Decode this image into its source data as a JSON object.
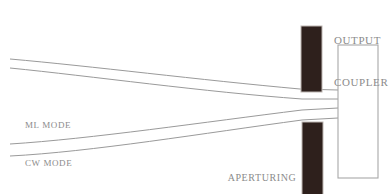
{
  "figure": {
    "type": "optical-schematic",
    "title_visible": false,
    "background_color": "#ffffff",
    "width": 391,
    "height": 194
  },
  "labels": {
    "ml_mode": "ML MODE",
    "cw_mode": "CW MODE",
    "aperturing_slit_line1": "APERTURING",
    "aperturing_slit_line2": "SLIT",
    "output_coupler_line1": "OUTPUT",
    "output_coupler_line2": "COUPLER"
  },
  "colors": {
    "ray_stroke": "#9a9a9a",
    "slit_fill": "#2e201c",
    "slit_stroke": "#bdb6b2",
    "coupler_stroke": "#a8a8a8",
    "coupler_fill": "#ffffff",
    "text": "#8b8b8b"
  },
  "geometry": {
    "rays": [
      {
        "name": "ml-mode-upper-ray",
        "path": "M 10 59 C 90 66, 200 80, 300 89 L 338 90"
      },
      {
        "name": "ml-mode-lower-ray",
        "path": "M 10 68 C 90 76, 205 92, 302 99 L 338 99"
      },
      {
        "name": "cw-mode-upper-ray",
        "path": "M 10 144 C 90 139, 205 122, 302 110 L 338 108"
      },
      {
        "name": "cw-mode-lower-ray",
        "path": "M 10 156 C 90 152, 205 133, 302 120 L 338 118"
      }
    ],
    "slit_upper": {
      "x": 301,
      "y": 26,
      "width": 21,
      "height": 66
    },
    "slit_lower": {
      "x": 302,
      "y": 122,
      "width": 21,
      "height": 73
    },
    "output_coupler": {
      "x": 338,
      "y": 45,
      "width": 40,
      "height": 133
    }
  }
}
